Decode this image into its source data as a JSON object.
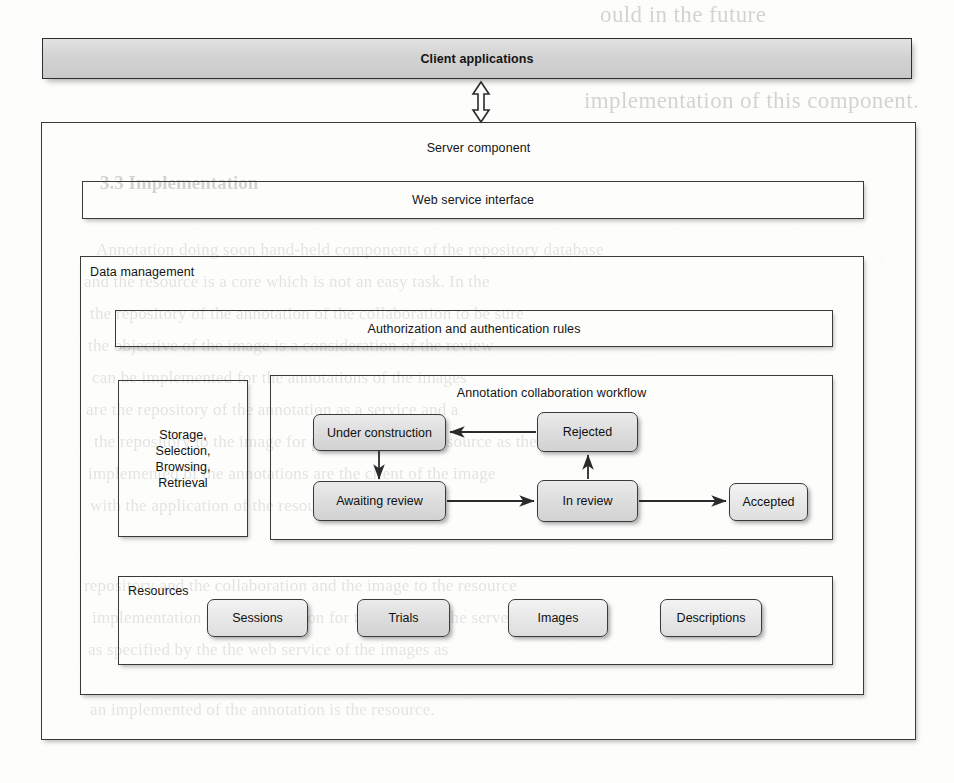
{
  "figure": {
    "client_layer": {
      "label": "Client applications"
    },
    "link_arrow": {
      "icon": "double-headed-vertical-arrow-icon"
    },
    "server": {
      "label": "Server component",
      "web_service": {
        "label": "Web service interface"
      },
      "data_management": {
        "label": "Data management",
        "auth_rules": {
          "label": "Authorization and authentication rules"
        },
        "storage": {
          "lines": [
            "Storage,",
            "Selection,",
            "Browsing,",
            "Retrieval"
          ]
        },
        "workflow": {
          "label": "Annotation collaboration workflow",
          "states": [
            {
              "id": "under-construction",
              "label": "Under construction"
            },
            {
              "id": "awaiting-review",
              "label": "Awaiting review"
            },
            {
              "id": "rejected",
              "label": "Rejected"
            },
            {
              "id": "in-review",
              "label": "In review"
            },
            {
              "id": "accepted",
              "label": "Accepted"
            }
          ],
          "transitions": [
            {
              "from": "under-construction",
              "to": "awaiting-review"
            },
            {
              "from": "awaiting-review",
              "to": "in-review"
            },
            {
              "from": "in-review",
              "to": "rejected"
            },
            {
              "from": "rejected",
              "to": "under-construction"
            },
            {
              "from": "in-review",
              "to": "accepted"
            }
          ]
        },
        "resources": {
          "label": "Resources",
          "items": [
            {
              "id": "sessions",
              "label": "Sessions"
            },
            {
              "id": "trials",
              "label": "Trials"
            },
            {
              "id": "images",
              "label": "Images"
            },
            {
              "id": "descriptions",
              "label": "Descriptions"
            }
          ]
        }
      }
    },
    "colors": {
      "node_fill": "#dcdcdc",
      "banner_fill": "#d3d3d3",
      "stroke": "#3a3a3a",
      "paper": "#fdfdfc"
    }
  },
  "background_text": {
    "top_right_1": "ould in the future",
    "top_right_2": "implementation of this component.",
    "section_heading": "3.3   Implementation",
    "body": [
      "Annotation doing soon hand-held components of the repository database",
      "and the resource is a core which is not an easy task. In the",
      "the repository of the annotation of the collaboration to be sure",
      "the objective of the image is a consideration of the review",
      "can be implemented for the annotations of the images",
      "are the repository of the annotation as a service and a",
      "the repository to the image for physicians in the resource as the",
      "implemented of the annotations are the client of the image",
      "with the application of the resources of the images.",
      "repository and the collaboration and the image to the resource",
      "implementation of the annotation for the image of the server",
      "as specified by the the web service of the images as",
      "an implemented of the annotation is the resource."
    ]
  }
}
